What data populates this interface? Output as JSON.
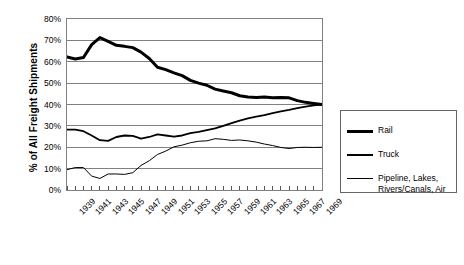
{
  "chart_data": {
    "type": "line",
    "title": "",
    "xlabel": "",
    "ylabel": "% of All Freight Shipments",
    "grid": true,
    "legend_position": "right",
    "xlim": [
      1939,
      1970
    ],
    "ylim": [
      0,
      80
    ],
    "y_tick_labels": [
      "80%",
      "70%",
      "60%",
      "50%",
      "40%",
      "30%",
      "20%",
      "10%",
      "0%"
    ],
    "y_tick_values": [
      80,
      70,
      60,
      50,
      40,
      30,
      20,
      10,
      0
    ],
    "x_tick_labels": [
      "1939",
      "1941",
      "1943",
      "1945",
      "1947",
      "1949",
      "1951",
      "1953",
      "1955",
      "1957",
      "1959",
      "1961",
      "1963",
      "1965",
      "1967",
      "1969"
    ],
    "x_tick_values": [
      1939,
      1941,
      1943,
      1945,
      1947,
      1949,
      1951,
      1953,
      1955,
      1957,
      1959,
      1961,
      1963,
      1965,
      1967,
      1969
    ],
    "x": [
      1939,
      1940,
      1941,
      1942,
      1943,
      1944,
      1945,
      1946,
      1947,
      1948,
      1949,
      1950,
      1951,
      1952,
      1953,
      1954,
      1955,
      1956,
      1957,
      1958,
      1959,
      1960,
      1961,
      1962,
      1963,
      1964,
      1965,
      1966,
      1967,
      1968,
      1969,
      1970
    ],
    "series": [
      {
        "name": "Rail",
        "line_width": 3,
        "color": "#000000",
        "values": [
          62.3,
          61.3,
          62.0,
          68.0,
          71.3,
          69.5,
          67.7,
          67.2,
          66.6,
          64.5,
          61.5,
          57.4,
          56.3,
          54.8,
          53.5,
          51.3,
          50.0,
          49.0,
          47.2,
          46.3,
          45.5,
          44.1,
          43.5,
          43.3,
          43.5,
          43.2,
          43.3,
          43.1,
          41.8,
          41.0,
          40.5,
          40.0
        ]
      },
      {
        "name": "Truck",
        "line_width": 1.8,
        "color": "#000000",
        "values": [
          28.2,
          28.2,
          27.5,
          25.5,
          23.3,
          23.0,
          24.8,
          25.5,
          25.3,
          24.0,
          24.8,
          26.0,
          25.5,
          25.0,
          25.5,
          26.6,
          27.2,
          28.0,
          28.8,
          30.0,
          31.3,
          32.5,
          33.5,
          34.3,
          35.0,
          36.0,
          36.8,
          37.5,
          38.3,
          39.0,
          39.6,
          40.0
        ]
      },
      {
        "name": "Pipeline, Lakes,\nRivers/Canals, Air",
        "line_width": 1,
        "color": "#000000",
        "values": [
          9.5,
          10.5,
          10.5,
          6.5,
          5.4,
          7.5,
          7.5,
          7.3,
          8.1,
          11.5,
          13.7,
          16.6,
          18.2,
          20.2,
          21.0,
          22.1,
          22.8,
          23.0,
          24.0,
          23.7,
          23.2,
          23.4,
          23.0,
          22.4,
          21.5,
          20.8,
          19.9,
          19.4,
          19.9,
          20.0,
          19.9,
          20.0
        ]
      }
    ],
    "legend": [
      {
        "label": "Rail",
        "line_width": 3
      },
      {
        "label": "Truck",
        "line_width": 2
      },
      {
        "label": "Pipeline, Lakes,\nRivers/Canals, Air",
        "line_width": 1
      }
    ]
  }
}
